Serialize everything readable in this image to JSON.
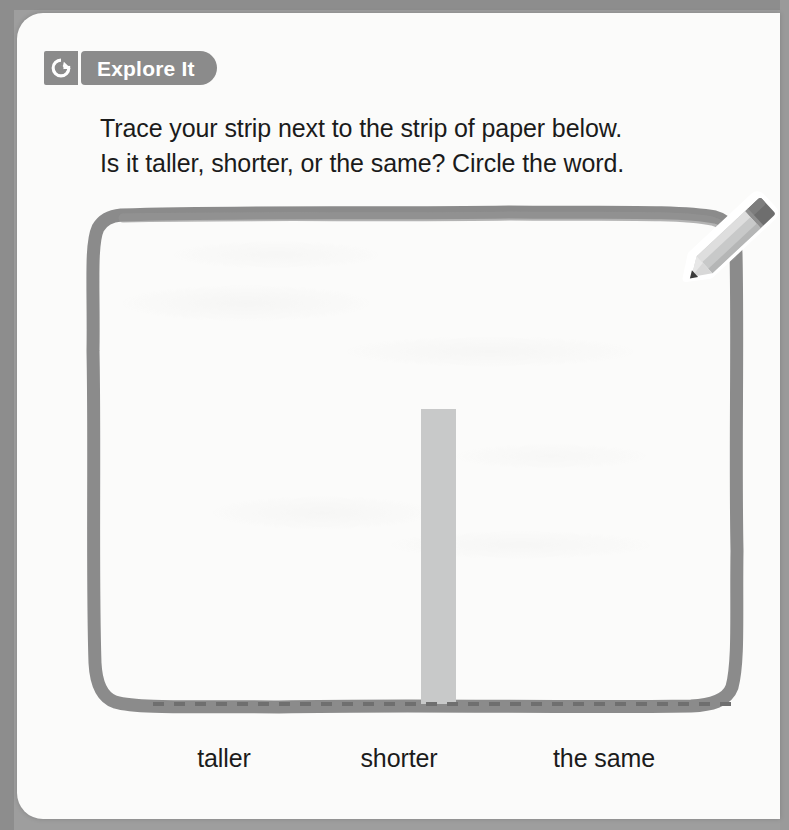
{
  "page": {
    "background_color": "#9e9e9e",
    "paper_color": "#fbfbfa"
  },
  "badge": {
    "icon_name": "explore-compass-g-icon",
    "label": "Explore It",
    "background_color": "#8b8b8b",
    "text_color": "#ffffff"
  },
  "instructions": {
    "line1": "Trace your strip next to the strip of paper below.",
    "line2": "Is it taller, shorter, or the same? Circle the word."
  },
  "workbox": {
    "border_color": "#8b8b8b",
    "description": "hand-drawn rounded rectangle work area",
    "strip": {
      "name": "paper-strip",
      "color": "#c8c9c9",
      "orientation": "vertical"
    },
    "baseline": {
      "name": "dashed-baseline",
      "style": "dashed",
      "color": "#6f6f6f"
    },
    "pencil": {
      "name": "pencil-icon",
      "body_color": "#c4c5c5",
      "ferrule_color": "#6e6e6e",
      "tip_color": "#3a3a3a"
    }
  },
  "answers": {
    "choices": [
      {
        "label": "taller"
      },
      {
        "label": "shorter"
      },
      {
        "label": "the same"
      }
    ]
  }
}
